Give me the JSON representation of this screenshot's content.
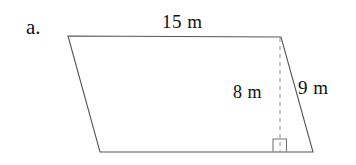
{
  "figure": {
    "item_label": "a.",
    "shape_name": "parallelogram",
    "background_color": "#ffffff",
    "stroke_color": "#555555",
    "text_color": "#111111",
    "dashed_stroke_color": "#999999",
    "labels": {
      "top_side": "15 m",
      "height": "8 m",
      "slant_side": "9 m"
    },
    "measurements": [
      {
        "name": "base",
        "value": 15,
        "unit": "m",
        "text": "15 m"
      },
      {
        "name": "height",
        "value": 8,
        "unit": "m",
        "text": "8 m"
      },
      {
        "name": "slant-side",
        "value": 9,
        "unit": "m",
        "text": "9 m"
      }
    ],
    "markers": {
      "right_angle": "right-angle-square"
    }
  }
}
